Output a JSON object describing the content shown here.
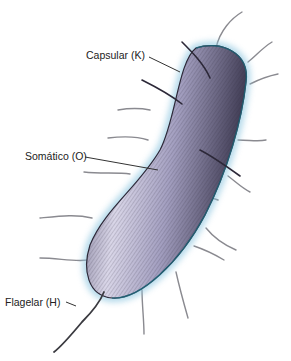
{
  "figure": {
    "labels": [
      {
        "id": "capsular",
        "text": "Capsular (K)"
      },
      {
        "id": "somatic",
        "text": "Somático (O)"
      },
      {
        "id": "flagellar",
        "text": "Flagelar (H)"
      }
    ],
    "colors": {
      "body": "#a39fc0",
      "body_light": "#d9d6e8",
      "body_dark": "#4a4560",
      "halo": "#8ec6e0",
      "hatch": "#2c2838",
      "fimbriae": "#8a8a90",
      "flagellum": "#3a3a40",
      "leader": "#333333"
    }
  }
}
